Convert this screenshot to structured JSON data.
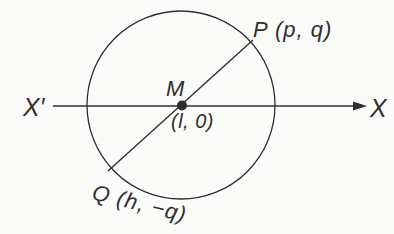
{
  "diagram": {
    "labels": {
      "point_p": "P (p, q)",
      "point_q": "Q (h, −q)",
      "center_name": "M",
      "center_coords": "(l, 0)",
      "axis_left_end": "X′",
      "axis_right_end": "X"
    },
    "colors": {
      "line": "#2f2f2f",
      "background": "#fbfbf9"
    }
  }
}
